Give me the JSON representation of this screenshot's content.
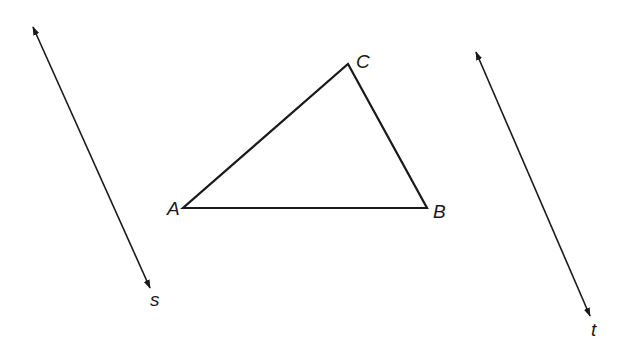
{
  "figure": {
    "stroke_color": "#1a1a1a",
    "background": "#ffffff"
  },
  "triangle": {
    "vertices": {
      "A": {
        "label": "A",
        "x": 183,
        "y": 208
      },
      "B": {
        "label": "B",
        "x": 427,
        "y": 208
      },
      "C": {
        "label": "C",
        "x": 348,
        "y": 64
      }
    }
  },
  "lines": {
    "s": {
      "label": "s",
      "x1": 33,
      "y1": 27,
      "x2": 150,
      "y2": 288
    },
    "t": {
      "label": "t",
      "x1": 476,
      "y1": 52,
      "x2": 590,
      "y2": 316
    }
  }
}
